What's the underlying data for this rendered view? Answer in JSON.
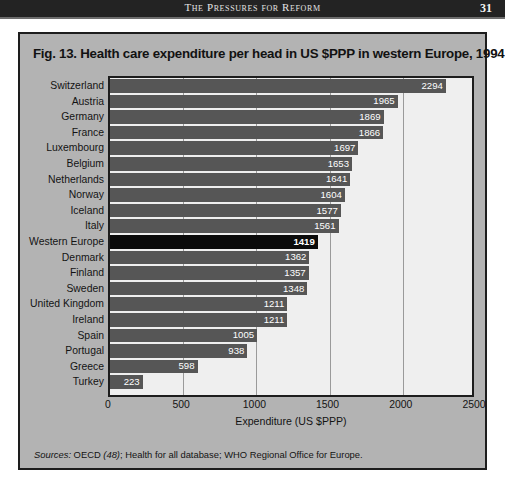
{
  "page": {
    "running_head": "The Pressures for Reform",
    "page_number": "31"
  },
  "figure": {
    "title": "Fig. 13. Health care expenditure per head in US $PPP in western Europe, 1994",
    "source_prefix": "Sources:",
    "source_text": " OECD ",
    "source_ref": "(48)",
    "source_rest": "; Health for all database; WHO Regional Office for Europe."
  },
  "colors": {
    "bar": "#565656",
    "bar_highlight": "#0b0b0b",
    "plot_bg": "#efefef",
    "figure_bg": "#b3b3b3",
    "frame": "#1d1d1d",
    "header_bar": "#232323"
  },
  "chart_data": {
    "type": "bar",
    "orientation": "horizontal",
    "title": "Fig. 13. Health care expenditure per head in US $PPP in western Europe, 1994",
    "xlabel": "Expenditure (US $PPP)",
    "ylabel": "",
    "xlim": [
      0,
      2500
    ],
    "xticks": [
      0,
      500,
      1000,
      1500,
      2000,
      2500
    ],
    "xtick_labels": [
      "0",
      "500",
      "1000",
      "1500",
      "2000",
      "2500"
    ],
    "grid": true,
    "legend": false,
    "highlight_category": "Western Europe",
    "categories": [
      "Switzerland",
      "Austria",
      "Germany",
      "France",
      "Luxembourg",
      "Belgium",
      "Netherlands",
      "Norway",
      "Iceland",
      "Italy",
      "Western Europe",
      "Denmark",
      "Finland",
      "Sweden",
      "United Kingdom",
      "Ireland",
      "Spain",
      "Portugal",
      "Greece",
      "Turkey"
    ],
    "values": [
      2294,
      1965,
      1869,
      1866,
      1697,
      1653,
      1641,
      1604,
      1577,
      1561,
      1419,
      1362,
      1357,
      1348,
      1211,
      1211,
      1005,
      938,
      598,
      223
    ],
    "value_labels": [
      "2294",
      "1965",
      "1869",
      "1866",
      "1697",
      "1653",
      "1641",
      "1604",
      "1577",
      "1561",
      "1419",
      "1362",
      "1357",
      "1348",
      "1211",
      "1211",
      "1005",
      "938",
      "598",
      "223"
    ]
  }
}
